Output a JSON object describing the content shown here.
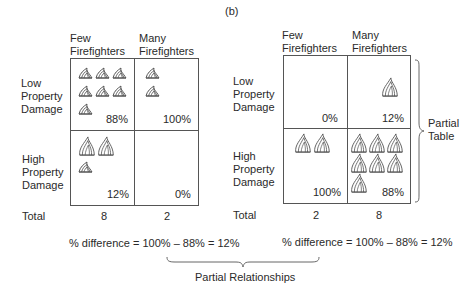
{
  "figure_label": "(b)",
  "left_table": {
    "col_headers": [
      "Few\nFirefighters",
      "Many\nFirefighters"
    ],
    "col_header_lines": [
      [
        "Few",
        "Firefighters"
      ],
      [
        "Many",
        "Firefighters"
      ]
    ],
    "row_headers": [
      [
        "Low",
        "Property",
        "Damage"
      ],
      [
        "High",
        "Property",
        "Damage"
      ]
    ],
    "cells": [
      {
        "row": "Low Property Damage",
        "col": "Few Firefighters",
        "percent": "88%",
        "flame_count": 7,
        "flame_size": "small"
      },
      {
        "row": "Low Property Damage",
        "col": "Many Firefighters",
        "percent": "100%",
        "flame_count": 2,
        "flame_size": "small"
      },
      {
        "row": "High Property Damage",
        "col": "Few Firefighters",
        "percent": "12%",
        "flame_count": 1,
        "flame_size": "mixed",
        "large_flames": 2,
        "small_flames": 1
      },
      {
        "row": "High Property Damage",
        "col": "Many Firefighters",
        "percent": "0%",
        "flame_count": 0
      }
    ],
    "total_label": "Total",
    "totals": [
      "8",
      "2"
    ],
    "difference": "% difference = 100% – 88% = 12%"
  },
  "right_table": {
    "col_header_lines": [
      [
        "Few",
        "Firefighters"
      ],
      [
        "Many",
        "Firefighters"
      ]
    ],
    "row_headers": [
      [
        "Low",
        "Property",
        "Damage"
      ],
      [
        "High",
        "Property",
        "Damage"
      ]
    ],
    "cells": [
      {
        "row": "Low Property Damage",
        "col": "Few Firefighters",
        "percent": "0%",
        "flame_count": 0
      },
      {
        "row": "Low Property Damage",
        "col": "Many Firefighters",
        "percent": "12%",
        "flame_count": 1,
        "flame_size": "large"
      },
      {
        "row": "High Property Damage",
        "col": "Few Firefighters",
        "percent": "100%",
        "flame_count": 2,
        "flame_size": "large"
      },
      {
        "row": "High Property Damage",
        "col": "Many Firefighters",
        "percent": "88%",
        "flame_count": 7,
        "flame_size": "large"
      }
    ],
    "total_label": "Total",
    "totals": [
      "2",
      "8"
    ],
    "difference": "% difference = 100% – 88% = 12%",
    "brace_label": [
      "Partial",
      "Table"
    ]
  },
  "bottom_brace_label": "Partial Relationships",
  "icons": {
    "flame": "flame-icon"
  },
  "colors": {
    "line": "#555555",
    "text": "#2a2a2a",
    "flame_stroke": "#555555"
  }
}
